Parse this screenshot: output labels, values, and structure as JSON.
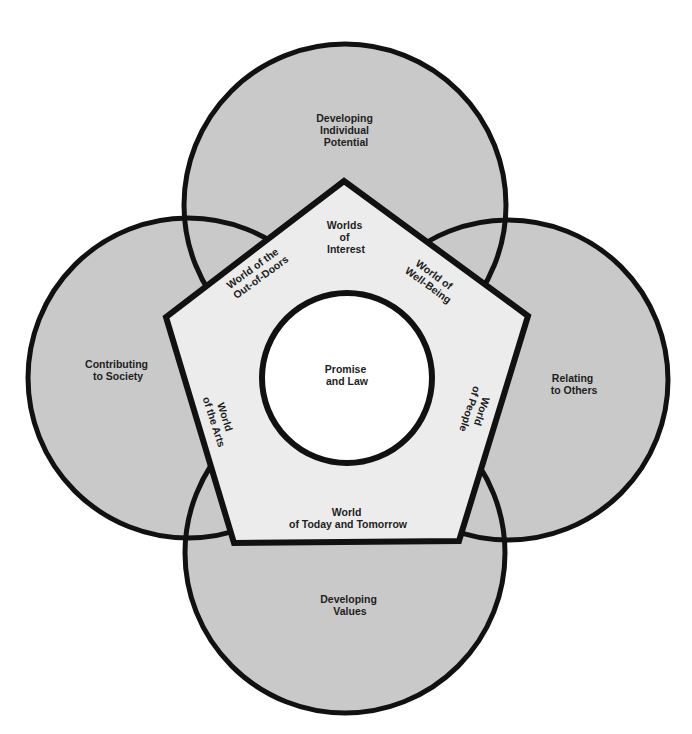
{
  "colors": {
    "circle_fill": "#c9c9c9",
    "pentagon_fill": "#ececec",
    "center_fill": "#ffffff",
    "stroke": "#111111"
  },
  "outer_circles": {
    "top": {
      "lines": [
        "Developing",
        "Individual",
        "Potential"
      ]
    },
    "left": {
      "lines": [
        "Contributing",
        "to Society"
      ]
    },
    "right": {
      "lines": [
        "Relating",
        "to Others"
      ]
    },
    "bottom": {
      "lines": [
        "Developing",
        "Values"
      ]
    }
  },
  "pentagon": {
    "top": {
      "lines": [
        "Worlds",
        "of",
        "Interest"
      ]
    },
    "upper_left": {
      "lines": [
        "World of the",
        "Out-of-Doors"
      ]
    },
    "upper_right": {
      "lines": [
        "World of",
        "Well-Being"
      ]
    },
    "lower_left": {
      "lines": [
        "World",
        "of the Arts"
      ]
    },
    "lower_right": {
      "lines": [
        "World",
        "of People"
      ]
    },
    "bottom": {
      "lines": [
        "World",
        "of Today and Tomorrow"
      ]
    }
  },
  "center": {
    "lines": [
      "Promise",
      "and Law"
    ]
  }
}
